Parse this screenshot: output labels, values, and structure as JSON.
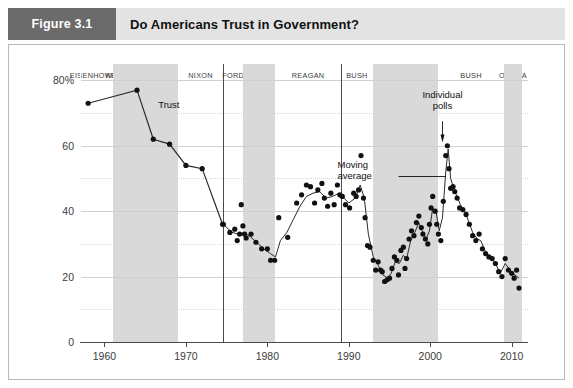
{
  "header": {
    "figure_number": "Figure 3.1",
    "title": "Do Americans Trust in Government?"
  },
  "chart_data": {
    "type": "scatter",
    "title": "Do Americans Trust in Government?",
    "xlabel": "",
    "ylabel": "",
    "xlim": [
      1957,
      2012
    ],
    "ylim": [
      0,
      85
    ],
    "grid": true,
    "legend_position": "none",
    "ytick_labels": [
      "0",
      "20",
      "40",
      "60",
      "80%"
    ],
    "yticks": [
      0,
      20,
      40,
      60,
      80
    ],
    "y_minor_gridlines": [
      10,
      30,
      50,
      70
    ],
    "xtick_labels": [
      "1960",
      "1970",
      "1980",
      "1990",
      "2000",
      "2010"
    ],
    "xticks": [
      1960,
      1970,
      1980,
      1990,
      2000,
      2010
    ],
    "annotations": [
      {
        "name": "trust",
        "text": "Trust",
        "x": 1966.6,
        "y": 72.5
      },
      {
        "name": "individual-polls",
        "text": "Individual polls",
        "x": 2001.5,
        "y": 73.0
      },
      {
        "name": "moving-average",
        "text": "Moving average",
        "x": 1995.0,
        "y": 52.0
      }
    ],
    "era_bands": [
      {
        "label": "EISENHOWER",
        "start": 1957.0,
        "end": 1961.0,
        "shaded": false
      },
      {
        "label": "KENNEDY",
        "start": 1961.0,
        "end": 1963.9,
        "shaded": true
      },
      {
        "label": "JOHNSON",
        "start": 1963.9,
        "end": 1969.0,
        "shaded": true
      },
      {
        "label": "NIXON",
        "start": 1969.0,
        "end": 1974.6,
        "shaded": false
      },
      {
        "label": "FORD",
        "start": 1974.6,
        "end": 1977.0,
        "shaded": false
      },
      {
        "label": "CARTER",
        "start": 1977.0,
        "end": 1981.0,
        "shaded": true
      },
      {
        "label": "REAGAN",
        "start": 1981.0,
        "end": 1989.0,
        "shaded": false
      },
      {
        "label": "BUSH",
        "start": 1989.0,
        "end": 1993.0,
        "shaded": false
      },
      {
        "label": "CLINTON",
        "start": 1993.0,
        "end": 2001.0,
        "shaded": true
      },
      {
        "label": "BUSH",
        "start": 2001.0,
        "end": 2009.0,
        "shaded": false
      },
      {
        "label": "OBAMA",
        "start": 2009.0,
        "end": 2011.3,
        "shaded": true
      }
    ],
    "era_dividers": [
      1974.6,
      1989.0
    ],
    "series": [
      {
        "name": "Trust (early biennial series)",
        "type": "line+markers",
        "points": [
          [
            1958.0,
            73.0
          ],
          [
            1964.0,
            77.0
          ],
          [
            1966.0,
            62.0
          ],
          [
            1968.0,
            60.5
          ],
          [
            1970.0,
            54.0
          ],
          [
            1972.0,
            53.0
          ],
          [
            1974.5,
            36.0
          ]
        ]
      },
      {
        "name": "Individual polls",
        "type": "scatter",
        "points": [
          [
            1974.6,
            36.0
          ],
          [
            1975.4,
            33.5
          ],
          [
            1976.0,
            34.5
          ],
          [
            1976.3,
            31.0
          ],
          [
            1976.6,
            33.0
          ],
          [
            1977.0,
            35.5
          ],
          [
            1977.2,
            33.0
          ],
          [
            1977.4,
            31.8
          ],
          [
            1976.8,
            42.0
          ],
          [
            1978.0,
            33.0
          ],
          [
            1978.6,
            30.5
          ],
          [
            1979.3,
            28.5
          ],
          [
            1980.0,
            28.5
          ],
          [
            1980.4,
            25.0
          ],
          [
            1980.9,
            25.0
          ],
          [
            1981.4,
            38.0
          ],
          [
            1982.5,
            32.0
          ],
          [
            1983.6,
            42.5
          ],
          [
            1984.2,
            45.0
          ],
          [
            1984.8,
            48.0
          ],
          [
            1985.3,
            47.5
          ],
          [
            1985.8,
            42.5
          ],
          [
            1986.2,
            46.5
          ],
          [
            1986.7,
            48.5
          ],
          [
            1987.0,
            44.0
          ],
          [
            1987.4,
            41.5
          ],
          [
            1987.8,
            45.5
          ],
          [
            1988.2,
            42.0
          ],
          [
            1988.6,
            48.0
          ],
          [
            1988.9,
            45.0
          ],
          [
            1989.2,
            44.5
          ],
          [
            1989.6,
            42.0
          ],
          [
            1990.1,
            41.0
          ],
          [
            1990.6,
            45.5
          ],
          [
            1990.9,
            44.5
          ],
          [
            1991.2,
            46.5
          ],
          [
            1991.5,
            57.0
          ],
          [
            1991.8,
            44.0
          ],
          [
            1992.0,
            38.0
          ],
          [
            1992.3,
            29.5
          ],
          [
            1992.6,
            29.0
          ],
          [
            1993.0,
            25.0
          ],
          [
            1993.3,
            22.0
          ],
          [
            1993.6,
            24.5
          ],
          [
            1993.9,
            22.0
          ],
          [
            1994.1,
            21.5
          ],
          [
            1994.4,
            18.5
          ],
          [
            1994.7,
            19.0
          ],
          [
            1995.0,
            19.5
          ],
          [
            1995.3,
            22.5
          ],
          [
            1995.6,
            26.0
          ],
          [
            1995.9,
            25.0
          ],
          [
            1996.1,
            20.5
          ],
          [
            1996.4,
            28.0
          ],
          [
            1996.7,
            29.0
          ],
          [
            1996.9,
            22.5
          ],
          [
            1997.1,
            25.5
          ],
          [
            1997.4,
            31.5
          ],
          [
            1997.7,
            34.0
          ],
          [
            1998.0,
            32.5
          ],
          [
            1998.3,
            36.5
          ],
          [
            1998.6,
            38.5
          ],
          [
            1998.9,
            35.0
          ],
          [
            1999.1,
            33.0
          ],
          [
            1999.4,
            31.5
          ],
          [
            1999.7,
            30.0
          ],
          [
            1999.9,
            36.0
          ],
          [
            2000.1,
            41.0
          ],
          [
            2000.3,
            44.5
          ],
          [
            2000.6,
            40.0
          ],
          [
            2000.8,
            36.0
          ],
          [
            2001.0,
            33.0
          ],
          [
            2001.3,
            31.0
          ],
          [
            2001.6,
            43.0
          ],
          [
            2001.9,
            57.0
          ],
          [
            2002.1,
            60.0
          ],
          [
            2002.3,
            53.0
          ],
          [
            2002.5,
            47.0
          ],
          [
            2002.8,
            47.5
          ],
          [
            2003.0,
            46.0
          ],
          [
            2003.3,
            44.0
          ],
          [
            2003.6,
            41.0
          ],
          [
            2004.0,
            40.5
          ],
          [
            2004.4,
            39.0
          ],
          [
            2004.8,
            36.0
          ],
          [
            2005.2,
            32.5
          ],
          [
            2005.6,
            31.0
          ],
          [
            2006.0,
            33.0
          ],
          [
            2006.4,
            28.5
          ],
          [
            2006.8,
            27.0
          ],
          [
            2007.2,
            26.0
          ],
          [
            2007.6,
            25.5
          ],
          [
            2008.0,
            24.0
          ],
          [
            2008.4,
            21.5
          ],
          [
            2008.8,
            20.0
          ],
          [
            2009.2,
            25.5
          ],
          [
            2009.6,
            22.0
          ],
          [
            2010.0,
            21.0
          ],
          [
            2010.3,
            19.5
          ],
          [
            2010.6,
            22.0
          ],
          [
            2010.9,
            16.5
          ]
        ]
      },
      {
        "name": "Moving average",
        "type": "line",
        "points": [
          [
            1974.6,
            36.0
          ],
          [
            1975.6,
            33.6
          ],
          [
            1976.4,
            33.0
          ],
          [
            1977.2,
            33.4
          ],
          [
            1978.0,
            32.0
          ],
          [
            1978.8,
            30.2
          ],
          [
            1979.6,
            28.4
          ],
          [
            1980.4,
            27.0
          ],
          [
            1981.0,
            26.0
          ],
          [
            1981.6,
            31.0
          ],
          [
            1982.4,
            33.5
          ],
          [
            1983.2,
            37.5
          ],
          [
            1984.0,
            41.5
          ],
          [
            1984.8,
            44.5
          ],
          [
            1985.6,
            45.5
          ],
          [
            1986.4,
            46.0
          ],
          [
            1987.2,
            44.0
          ],
          [
            1988.0,
            44.5
          ],
          [
            1988.8,
            45.5
          ],
          [
            1989.4,
            44.0
          ],
          [
            1990.0,
            42.5
          ],
          [
            1990.8,
            44.0
          ],
          [
            1991.4,
            48.0
          ],
          [
            1991.9,
            44.0
          ],
          [
            1992.4,
            33.0
          ],
          [
            1993.0,
            26.0
          ],
          [
            1993.6,
            23.5
          ],
          [
            1994.2,
            20.5
          ],
          [
            1994.8,
            19.5
          ],
          [
            1995.2,
            21.0
          ],
          [
            1995.7,
            24.5
          ],
          [
            1996.2,
            24.0
          ],
          [
            1996.7,
            26.5
          ],
          [
            1997.1,
            25.5
          ],
          [
            1997.6,
            31.0
          ],
          [
            1998.1,
            33.5
          ],
          [
            1998.6,
            36.5
          ],
          [
            1999.0,
            34.0
          ],
          [
            1999.5,
            31.5
          ],
          [
            1999.9,
            34.0
          ],
          [
            2000.3,
            41.0
          ],
          [
            2000.7,
            40.0
          ],
          [
            2001.1,
            34.0
          ],
          [
            2001.5,
            38.0
          ],
          [
            2001.9,
            52.0
          ],
          [
            2002.2,
            59.0
          ],
          [
            2002.5,
            50.0
          ],
          [
            2002.9,
            47.0
          ],
          [
            2003.2,
            45.0
          ],
          [
            2003.7,
            42.0
          ],
          [
            2004.2,
            40.0
          ],
          [
            2004.7,
            37.0
          ],
          [
            2005.2,
            33.5
          ],
          [
            2005.8,
            31.5
          ],
          [
            2006.2,
            31.0
          ],
          [
            2006.8,
            27.5
          ],
          [
            2007.4,
            26.0
          ],
          [
            2008.0,
            24.0
          ],
          [
            2008.6,
            21.0
          ],
          [
            2009.2,
            24.0
          ],
          [
            2009.8,
            22.0
          ],
          [
            2010.4,
            20.5
          ],
          [
            2010.9,
            19.5
          ]
        ]
      }
    ]
  }
}
